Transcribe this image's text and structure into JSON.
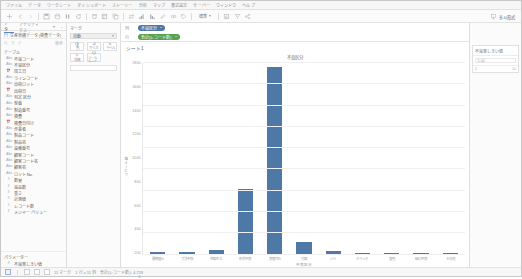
{
  "app": {
    "name": "Tableau Desktop",
    "menu": [
      "ファイル",
      "データ",
      "ワークシート",
      "ダッシュボード",
      "ストーリー",
      "分析",
      "マップ",
      "書式設定",
      "サーバー",
      "ウィンドウ",
      "ヘルプ"
    ]
  },
  "toolbar": {
    "icons": [
      "tableau-logo-icon",
      "back-icon",
      "forward-icon",
      "save-icon",
      "new-data-source-icon",
      "pause-icon",
      "refresh-icon",
      "clear-sheet-icon",
      "new-worksheet-icon",
      "duplicate-icon",
      "swap-icon",
      "sort-asc-icon",
      "sort-desc-icon",
      "highlight-icon",
      "group-icon",
      "labels-icon",
      "fix-axis-icon",
      "presentation-icon",
      "share-icon"
    ],
    "fit_label": "標準",
    "showme_label": "표시形式",
    "showme_icon": "show-me-icon"
  },
  "sidebar": {
    "tabs": [
      {
        "label": "データ",
        "id": "data"
      },
      {
        "label": "アナリティクス",
        "id": "analytics"
      }
    ],
    "active_tab": "データ",
    "datasource": {
      "icon": "database-icon",
      "name": "生産実績データ (検査データ)"
    },
    "search": {
      "icon": "search-icon",
      "placeholder": "検索"
    },
    "section_dimensions": "テーブル",
    "fields": [
      {
        "name": "不良コード",
        "type": "string"
      },
      {
        "name": "不良区分",
        "type": "string"
      },
      {
        "name": "加工日",
        "type": "date"
      },
      {
        "name": "ラインコード",
        "type": "string"
      },
      {
        "name": "出荷ロット",
        "type": "string"
      },
      {
        "name": "出荷日",
        "type": "date"
      },
      {
        "name": "判定 区分",
        "type": "string"
      },
      {
        "name": "型番",
        "type": "string"
      },
      {
        "name": "製造番号",
        "type": "string"
      },
      {
        "name": "検査",
        "type": "string"
      },
      {
        "name": "検査日付け",
        "type": "date"
      },
      {
        "name": "作業者",
        "type": "string"
      },
      {
        "name": "製品コード",
        "type": "string"
      },
      {
        "name": "製品名",
        "type": "string"
      },
      {
        "name": "設備番号",
        "type": "string"
      },
      {
        "name": "顧客コード",
        "type": "string"
      },
      {
        "name": "顧客コード名",
        "type": "string"
      },
      {
        "name": "顧客名",
        "type": "string"
      },
      {
        "name": "ロット No.",
        "type": "string"
      },
      {
        "name": "数量",
        "type": "number"
      },
      {
        "name": "良品数",
        "type": "number"
      },
      {
        "name": "重さ",
        "type": "number"
      },
      {
        "name": "計測値",
        "type": "number"
      },
      {
        "name": "レコード数",
        "type": "number"
      },
      {
        "name": "メジャー バリュー",
        "type": "number"
      }
    ],
    "section_parameters": "パラメーター",
    "parameters": [
      {
        "name": "不良率しきい値",
        "type": "number"
      }
    ]
  },
  "marks": {
    "title": "マーク",
    "mark_type": "自動",
    "buttons": [
      {
        "label": "色",
        "icon": "color-icon"
      },
      {
        "label": "サイズ",
        "icon": "size-icon"
      },
      {
        "label": "ラベル",
        "icon": "label-icon"
      },
      {
        "label": "詳細",
        "icon": "detail-icon"
      },
      {
        "label": "ツール ヒント",
        "icon": "tooltip-icon"
      }
    ]
  },
  "shelves": [
    {
      "label": "列",
      "pill": {
        "text": "不良区分",
        "kind": "dimension"
      }
    },
    {
      "label": "行",
      "pill": {
        "text": "合計(レコード数)",
        "kind": "measure"
      }
    }
  ],
  "sheet": {
    "title": "シート1"
  },
  "right_panel": {
    "card": {
      "title": "不良率しきい値",
      "value": "5.00",
      "min": "0",
      "max": "10"
    }
  },
  "statusbar": {
    "marks_text": "11 マーク",
    "rows_cols": "1 行 x 11 列",
    "sum_text": "合計(レコード数): 4,728",
    "tabs": [
      "sheet-tab-1",
      "new-worksheet-tab",
      "new-dashboard-tab",
      "new-story-tab"
    ]
  },
  "colors": {
    "bar": "#4e79a7",
    "dimension_pill": "#4e79a7",
    "measure_pill": "#59a14f",
    "accent": "#5a85c4"
  },
  "chart_data": {
    "type": "bar",
    "title": "不良区分",
    "xlabel": "不良区分",
    "ylabel": "レコード数",
    "categories": [
      "異物混入",
      "寸法不良",
      "外観キズ",
      "形状不良",
      "表面汚れ",
      "打痕",
      "バリ",
      "クラック",
      "変色",
      "組付不良",
      "その他"
    ],
    "values": [
      28,
      25,
      40,
      620,
      1760,
      115,
      30,
      18,
      12,
      9,
      6
    ],
    "ylim": [
      0,
      1800
    ],
    "yticks": [
      0,
      200,
      400,
      600,
      800,
      1000,
      1200,
      1400,
      1600,
      1800
    ],
    "grid": true,
    "legend": "none"
  }
}
